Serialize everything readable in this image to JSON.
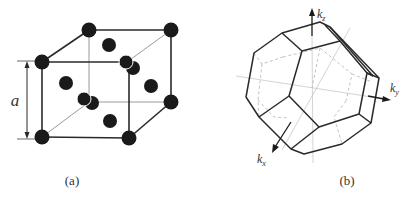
{
  "figure": {
    "panel_a": {
      "caption": "(a)",
      "dimension_label": "a",
      "description": "Face-centered cubic unit cell with lattice constant a"
    },
    "panel_b": {
      "caption": "(b)",
      "axes": {
        "kz": {
          "base": "k",
          "sub": "z"
        },
        "ky": {
          "base": "k",
          "sub": "y"
        },
        "kx": {
          "base": "k",
          "sub": "x"
        }
      },
      "description": "First Brillouin zone (truncated octahedron) with reciprocal axes"
    },
    "colors": {
      "line": "#2a2a2a",
      "atom": "#1a1a1a",
      "hidden_line": "#bbbbbb",
      "axis_line": "#c8c8c8"
    }
  }
}
